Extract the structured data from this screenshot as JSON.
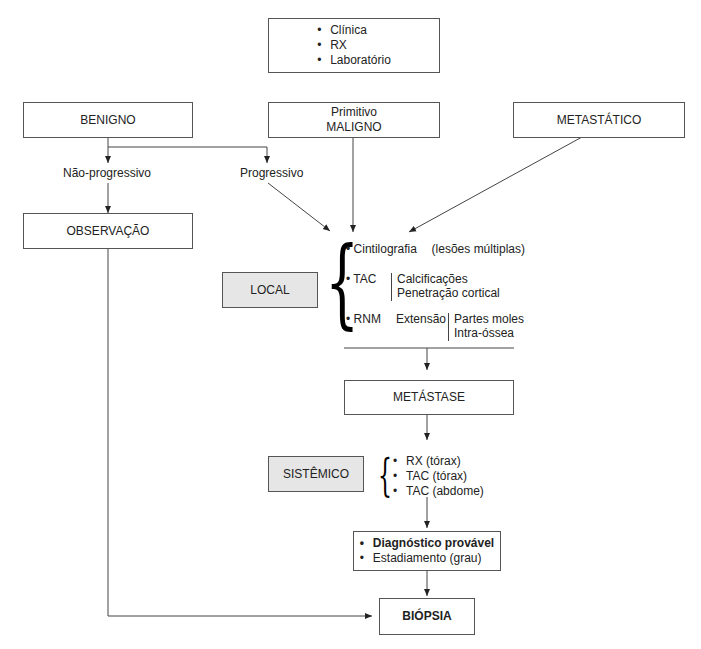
{
  "initial_box": {
    "items": [
      "Clínica",
      "RX",
      "Laboratório"
    ]
  },
  "top_boxes": {
    "benigno": "BENIGNO",
    "maligno_line1": "Primitivo",
    "maligno_line2": "MALIGNO",
    "metastatico": "METASTÁTICO"
  },
  "branch_labels": {
    "nao_progressivo": "Não-progressivo",
    "progressivo": "Progressivo"
  },
  "observacao": "OBSERVAÇÃO",
  "local": {
    "label": "LOCAL",
    "cintilografia": {
      "name": "Cintilografia",
      "note": "(lesões múltiplas)"
    },
    "tac": {
      "name": "TAC",
      "details": [
        "Calcificações",
        "Penetração cortical"
      ]
    },
    "rnm": {
      "name": "RNM",
      "aspect": "Extensão",
      "details": [
        "Partes moles",
        "Intra-óssea"
      ]
    }
  },
  "metastase": "METÁSTASE",
  "sistemico": {
    "label": "SISTÊMICO",
    "items": [
      "RX (tórax)",
      "TAC (tórax)",
      "TAC (abdome)"
    ]
  },
  "diagnostico_box": {
    "items": [
      "Diagnóstico provável",
      "Estadiamento (grau)"
    ]
  },
  "biopsia": "BIÓPSIA",
  "colors": {
    "line": "#444444",
    "box_border": "#555555",
    "shaded_fill": "#e6e6e6"
  }
}
